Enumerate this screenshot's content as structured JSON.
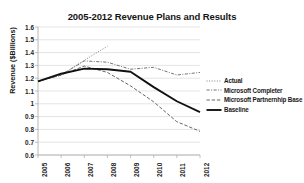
{
  "chart_data": {
    "type": "line",
    "title": "2005-2012 Revenue Plans and Results",
    "xlabel": "",
    "ylabel": "Revenue ($Billions)",
    "categories": [
      "2005",
      "2006",
      "2007",
      "2008",
      "2009",
      "2010",
      "2011",
      "2012"
    ],
    "ylim": [
      0.6,
      1.6
    ],
    "ytick_step": 0.1,
    "yticks": [
      "1.6",
      "1.5",
      "1.4",
      "1.3",
      "1.2",
      "1.1",
      "1",
      "0.9",
      "0.8",
      "0.7",
      "0.6"
    ],
    "grid": "horizontal",
    "legend_position": "right",
    "series": [
      {
        "name": "Actual",
        "style": "dotted",
        "color": "#7a7a7a",
        "values": [
          1.175,
          1.225,
          1.34,
          1.45,
          null,
          null,
          null,
          null
        ]
      },
      {
        "name": "Microsoft Completer",
        "style": "dash-dot",
        "color": "#6e6e6e",
        "values": [
          1.175,
          1.225,
          1.335,
          1.325,
          1.27,
          1.285,
          1.225,
          1.245
        ]
      },
      {
        "name": "Microsoft Partnernhip Base",
        "style": "dashed",
        "color": "#5e5e5e",
        "values": [
          1.175,
          1.225,
          1.295,
          1.245,
          1.14,
          1.015,
          0.86,
          0.785
        ]
      },
      {
        "name": "Baseline",
        "style": "solid",
        "color": "#111111",
        "values": [
          1.175,
          1.235,
          1.275,
          1.27,
          1.25,
          1.13,
          1.02,
          0.935
        ]
      }
    ]
  },
  "axes": {
    "y_title": "Revenue ($Billions)",
    "y_min": 0.6,
    "y_max": 1.6
  },
  "legend": {
    "entries": [
      {
        "label": "Actual"
      },
      {
        "label": "Microsoft Completer"
      },
      {
        "label": "Microsoft Partnernhip Base"
      },
      {
        "label": "Baseline"
      }
    ]
  },
  "colors": {
    "grid": "#d9d9d9",
    "axis": "#b0b0b0",
    "text": "#1a1a1a",
    "background": "#ffffff"
  }
}
